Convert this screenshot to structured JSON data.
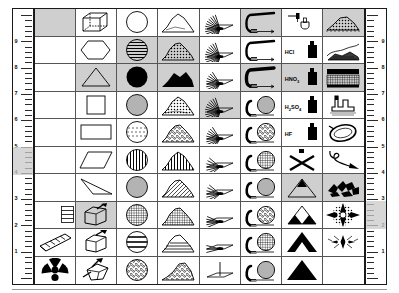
{
  "chart_data": {
    "type": "table",
    "columns": 8,
    "rows": 10,
    "cell_count": 80
  },
  "rulers": {
    "left": {
      "name": "left-ruler",
      "labels": [
        "9",
        "8",
        "7",
        "6",
        "5",
        "4",
        "3",
        "2",
        "1"
      ],
      "highlight": "5"
    },
    "right": {
      "name": "right-ruler",
      "labels": [
        "9",
        "8",
        "7",
        "6",
        "5",
        "4",
        "3",
        "2",
        "1"
      ],
      "highlight": "3"
    }
  },
  "colors": {
    "highlight": "#cfcfcf",
    "ink": "#000000",
    "grid_line": "#555555",
    "border": "#1a1a1a"
  },
  "cells": [
    {
      "n": "1",
      "icon": "roman-numeral-i",
      "label": "I",
      "hl": true
    },
    {
      "n": "11",
      "icon": "wireframe-cube",
      "hl": false
    },
    {
      "n": "21",
      "icon": "circle-outline",
      "hl": false
    },
    {
      "n": "31",
      "icon": "mound-low-outline",
      "hl": false
    },
    {
      "n": "41",
      "icon": "spray-fan-dense",
      "hl": false
    },
    {
      "n": "51",
      "icon": "hook-pipe-wide",
      "hl": true
    },
    {
      "n": "61",
      "icon": "dropper-flask",
      "hl": false
    },
    {
      "n": "71",
      "icon": "mound-dotted-fill",
      "hl": true
    },
    {
      "n": "2",
      "icon": "roman-numeral-ii",
      "label": "II",
      "hl": false
    },
    {
      "n": "12",
      "icon": "hexagon-outline",
      "hl": false
    },
    {
      "n": "22",
      "icon": "circle-horizontal-lines",
      "hl": true
    },
    {
      "n": "32",
      "icon": "mound-speckled",
      "hl": true
    },
    {
      "n": "42",
      "icon": "spray-fan-dense",
      "hl": false
    },
    {
      "n": "52",
      "icon": "hook-pipe-wide",
      "hl": false
    },
    {
      "n": "62",
      "icon": "acid-bottle",
      "label": "HCl",
      "hl": false
    },
    {
      "n": "72",
      "icon": "ridge-dark-strata",
      "hl": false
    },
    {
      "n": "3",
      "icon": "roman-numeral-iii",
      "label": "III",
      "hl": false
    },
    {
      "n": "13",
      "icon": "triangle-outline",
      "hl": true
    },
    {
      "n": "23",
      "icon": "circle-solid-black",
      "hl": true
    },
    {
      "n": "33",
      "icon": "mound-solid-black",
      "hl": true
    },
    {
      "n": "43",
      "icon": "spray-fan-medium",
      "hl": false
    },
    {
      "n": "53",
      "icon": "hook-pipe-thick",
      "hl": true
    },
    {
      "n": "63",
      "icon": "acid-bottle",
      "label": "HNO3",
      "hl": true
    },
    {
      "n": "73",
      "icon": "hatched-band-block",
      "hl": true
    },
    {
      "n": "4",
      "icon": "roman-numeral-iv",
      "label": "IV",
      "hl": false
    },
    {
      "n": "14",
      "icon": "square-outline",
      "hl": false
    },
    {
      "n": "24",
      "icon": "circle-thin-lines",
      "hl": false
    },
    {
      "n": "34",
      "icon": "mound-stipple",
      "hl": false
    },
    {
      "n": "44",
      "icon": "spray-fan-dense",
      "hl": true
    },
    {
      "n": "54",
      "icon": "hook-with-circle-lines",
      "hl": false
    },
    {
      "n": "64",
      "icon": "acid-bottle",
      "label": "H2SO4",
      "hl": false
    },
    {
      "n": "74",
      "icon": "factory-stack",
      "hl": false
    },
    {
      "n": "5",
      "icon": "roman-numeral-v",
      "label": "V",
      "hl": false
    },
    {
      "n": "15",
      "icon": "rectangle-outline",
      "hl": false
    },
    {
      "n": "25",
      "icon": "circle-dashed-lines",
      "hl": false
    },
    {
      "n": "35",
      "icon": "mound-coarse-stipple",
      "hl": false
    },
    {
      "n": "45",
      "icon": "spray-fan-medium",
      "hl": false
    },
    {
      "n": "55",
      "icon": "hook-with-circle-dots",
      "hl": false
    },
    {
      "n": "65",
      "icon": "acid-bottle",
      "label": "HF",
      "hl": false
    },
    {
      "n": "75",
      "icon": "ring-loop-outline",
      "hl": false
    },
    {
      "n": "6",
      "icon": "roman-numeral-vi",
      "label": "VI",
      "hl": false
    },
    {
      "n": "16",
      "icon": "parallelogram-outline",
      "hl": false
    },
    {
      "n": "26",
      "icon": "circle-vertical-lines",
      "hl": false
    },
    {
      "n": "36",
      "icon": "mound-vertical-hatch",
      "hl": false
    },
    {
      "n": "46",
      "icon": "spray-fan-sparse",
      "hl": false
    },
    {
      "n": "56",
      "icon": "hook-with-circle-grid",
      "hl": false
    },
    {
      "n": "66",
      "icon": "bottle-crossed-out",
      "hl": false
    },
    {
      "n": "76",
      "icon": "hook-line-loop",
      "hl": false
    },
    {
      "n": "7",
      "icon": "roman-numeral-vii",
      "label": "VII",
      "hl": false
    },
    {
      "n": "17",
      "icon": "thin-wedge-outline",
      "hl": false
    },
    {
      "n": "27",
      "icon": "circle-fine-vertical",
      "hl": false
    },
    {
      "n": "37",
      "icon": "mound-diagonal-hatch",
      "hl": false
    },
    {
      "n": "47",
      "icon": "spray-fan-sparse",
      "hl": false
    },
    {
      "n": "57",
      "icon": "hook-with-circle-lines",
      "hl": false
    },
    {
      "n": "67",
      "icon": "triangle-outline-tipped",
      "hl": true
    },
    {
      "n": "77",
      "icon": "rubble-debris",
      "hl": true
    },
    {
      "n": "8",
      "icon": "roman-numeral-viii",
      "label": "VIII",
      "hl": false
    },
    {
      "n": "18",
      "icon": "box-with-pick",
      "hl": true
    },
    {
      "n": "28",
      "icon": "circle-cross-hatch",
      "hl": false
    },
    {
      "n": "38",
      "icon": "mound-grid-hatch",
      "hl": false
    },
    {
      "n": "48",
      "icon": "spray-narrow",
      "hl": false
    },
    {
      "n": "58",
      "icon": "hook-with-circle-dots",
      "hl": false
    },
    {
      "n": "68",
      "icon": "triangle-two-black-corners",
      "hl": false
    },
    {
      "n": "78",
      "icon": "burst-compass-rose",
      "hl": false
    },
    {
      "n": "9",
      "icon": "ladder-beam",
      "hl": false
    },
    {
      "n": "19",
      "icon": "box-with-pick-open",
      "hl": false
    },
    {
      "n": "29",
      "icon": "circle-wide-bands",
      "hl": false
    },
    {
      "n": "39",
      "icon": "mound-layered-strata",
      "hl": false
    },
    {
      "n": "49",
      "icon": "spray-narrow-thin",
      "hl": false
    },
    {
      "n": "59",
      "icon": "hook-with-circle-grid",
      "hl": false
    },
    {
      "n": "69",
      "icon": "sierpinski-triangle",
      "hl": false
    },
    {
      "n": "79",
      "icon": "burst-scatter",
      "hl": false
    },
    {
      "n": "10",
      "icon": "radiation-trefoil",
      "hl": false
    },
    {
      "n": "20",
      "icon": "box-tipped-tools",
      "hl": false
    },
    {
      "n": "30",
      "icon": "circle-mottled-fill",
      "hl": false
    },
    {
      "n": "40",
      "icon": "mound-rocky-fill",
      "hl": false
    },
    {
      "n": "50",
      "icon": "single-stake",
      "hl": false
    },
    {
      "n": "60",
      "icon": "hook-with-circle-lines",
      "hl": false
    },
    {
      "n": "70",
      "icon": "triangle-solid-black",
      "hl": false
    },
    {
      "n": "80",
      "icon": "exclamation-mark",
      "label": "!",
      "hl": false
    }
  ]
}
